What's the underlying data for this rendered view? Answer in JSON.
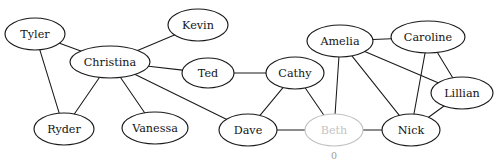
{
  "canvas": {
    "width": 496,
    "height": 164,
    "background": "#ffffff"
  },
  "style": {
    "node_stroke": "#1a1a1a",
    "node_fill": "#ffffff",
    "edge_color": "#1a1a1a",
    "label_color": "#141414",
    "dim_color": "#c2c2c2",
    "dim_label_color": "#c4c4c4",
    "sublabel_color": "#9a9a9a"
  },
  "graph": {
    "type": "node-link-diagram",
    "directed": false,
    "node_count": 13,
    "edge_count": 21,
    "nodes": [
      {
        "id": "tyler",
        "label": "Tyler",
        "cx": 35,
        "cy": 34,
        "rx": 30,
        "ry": 16,
        "state": "normal"
      },
      {
        "id": "christina",
        "label": "Christina",
        "cx": 110,
        "cy": 62,
        "rx": 40,
        "ry": 16,
        "state": "normal"
      },
      {
        "id": "kevin",
        "label": "Kevin",
        "cx": 198,
        "cy": 25,
        "rx": 30,
        "ry": 16,
        "state": "normal"
      },
      {
        "id": "ted",
        "label": "Ted",
        "cx": 208,
        "cy": 73,
        "rx": 26,
        "ry": 15,
        "state": "normal"
      },
      {
        "id": "cathy",
        "label": "Cathy",
        "cx": 295,
        "cy": 73,
        "rx": 29,
        "ry": 16,
        "state": "normal"
      },
      {
        "id": "amelia",
        "label": "Amelia",
        "cx": 340,
        "cy": 41,
        "rx": 33,
        "ry": 16,
        "state": "normal"
      },
      {
        "id": "caroline",
        "label": "Caroline",
        "cx": 428,
        "cy": 37,
        "rx": 37,
        "ry": 16,
        "state": "normal"
      },
      {
        "id": "lillian",
        "label": "Lillian",
        "cx": 462,
        "cy": 93,
        "rx": 31,
        "ry": 16,
        "state": "normal"
      },
      {
        "id": "ryder",
        "label": "Ryder",
        "cx": 64,
        "cy": 129,
        "rx": 30,
        "ry": 16,
        "state": "normal"
      },
      {
        "id": "vanessa",
        "label": "Vanessa",
        "cx": 155,
        "cy": 128,
        "rx": 33,
        "ry": 16,
        "state": "normal"
      },
      {
        "id": "dave",
        "label": "Dave",
        "cx": 248,
        "cy": 130,
        "rx": 29,
        "ry": 16,
        "state": "normal"
      },
      {
        "id": "beth",
        "label": "Beth",
        "cx": 334,
        "cy": 130,
        "rx": 29,
        "ry": 16,
        "state": "dimmed",
        "sublabel": "0"
      },
      {
        "id": "nick",
        "label": "Nick",
        "cx": 411,
        "cy": 130,
        "rx": 29,
        "ry": 16,
        "state": "normal"
      }
    ],
    "edges": [
      {
        "source": "tyler",
        "target": "christina",
        "state": "normal"
      },
      {
        "source": "tyler",
        "target": "ryder",
        "state": "normal"
      },
      {
        "source": "christina",
        "target": "kevin",
        "state": "normal"
      },
      {
        "source": "christina",
        "target": "ted",
        "state": "normal"
      },
      {
        "source": "christina",
        "target": "ryder",
        "state": "normal"
      },
      {
        "source": "christina",
        "target": "vanessa",
        "state": "normal"
      },
      {
        "source": "christina",
        "target": "dave",
        "state": "normal"
      },
      {
        "source": "ted",
        "target": "cathy",
        "state": "normal"
      },
      {
        "source": "cathy",
        "target": "dave",
        "state": "normal"
      },
      {
        "source": "cathy",
        "target": "beth",
        "state": "normal"
      },
      {
        "source": "dave",
        "target": "beth",
        "state": "normal"
      },
      {
        "source": "beth",
        "target": "nick",
        "state": "normal"
      },
      {
        "source": "beth",
        "target": "amelia",
        "state": "normal"
      },
      {
        "source": "amelia",
        "target": "caroline",
        "state": "normal"
      },
      {
        "source": "amelia",
        "target": "nick",
        "state": "normal"
      },
      {
        "source": "amelia",
        "target": "lillian",
        "state": "normal"
      },
      {
        "source": "caroline",
        "target": "nick",
        "state": "normal"
      },
      {
        "source": "caroline",
        "target": "lillian",
        "state": "normal"
      },
      {
        "source": "nick",
        "target": "lillian",
        "state": "normal"
      }
    ]
  }
}
